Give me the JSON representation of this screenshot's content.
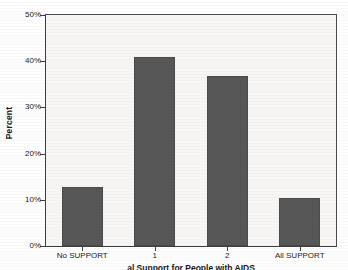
{
  "chart_data": {
    "type": "bar",
    "title": "",
    "xlabel": "al Support for People with AIDS",
    "ylabel": "Percent",
    "categories": [
      "No SUPPORT",
      "1",
      "2",
      "All SUPPORT"
    ],
    "values": [
      12.7,
      41.0,
      36.7,
      10.4
    ],
    "ylim": [
      0,
      50
    ],
    "ytick_labels": [
      "0%",
      "10%",
      "20%",
      "30%",
      "40%",
      "50%"
    ],
    "ytick_values": [
      0,
      10,
      20,
      30,
      40,
      50
    ],
    "grid": false,
    "legend": "none",
    "bar_color": "#575757",
    "plot_background": "#f7f6f4",
    "axis_color": "#3d3d3d"
  }
}
